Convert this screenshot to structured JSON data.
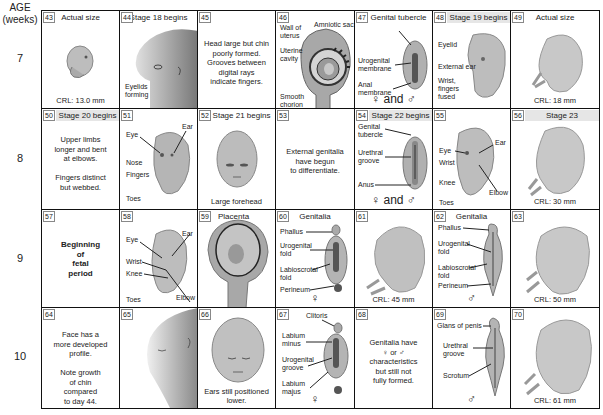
{
  "axis": {
    "header": "AGE\n(weeks)",
    "weeks": [
      "7",
      "8",
      "9",
      "10"
    ]
  },
  "cells": {
    "c43": {
      "num": "43",
      "header": "Actual size",
      "crl": "CRL: 13.0 mm"
    },
    "c44": {
      "num": "44",
      "header": "Stage 18 begins",
      "labels": [
        "Eyelids\nforming"
      ]
    },
    "c45": {
      "num": "45",
      "text": "Head large but chin\npoorly formed.\nGrooves between\ndigital rays\nindicate fingers."
    },
    "c46": {
      "num": "46",
      "labels": [
        "Wall of\nuterus",
        "Amniotic sac",
        "Uterine\ncavity",
        "Smooth\nchorion"
      ]
    },
    "c47": {
      "num": "47",
      "header": "Genital tubercle",
      "labels": [
        "Urogenital\nmembrane",
        "Anal\nmembrane"
      ],
      "symbol": "♀ and ♂"
    },
    "c48": {
      "num": "48",
      "header": "Stage 19 begins",
      "labels": [
        "Eyelid",
        "External ear",
        "Wrist,\nfingers\nfused"
      ]
    },
    "c49": {
      "num": "49",
      "header": "Actual size",
      "crl": "CRL: 18 mm"
    },
    "c50": {
      "num": "50",
      "header": "Stage 20 begins",
      "text": "Upper limbs\nlonger and bent\nat elbows.\n\nFingers distinct\nbut webbed."
    },
    "c51": {
      "num": "51",
      "labels": [
        "Eye",
        "Ear",
        "Nose",
        "Fingers",
        "Toes"
      ]
    },
    "c52": {
      "num": "52",
      "header": "Stage 21 begins",
      "caption": "Large forehead"
    },
    "c53": {
      "num": "53",
      "text": "External genitalia\nhave begun\nto differentiate."
    },
    "c54": {
      "num": "54",
      "header": "Stage 22 begins",
      "labels": [
        "Genital\ntubercle",
        "Urethral\ngroove",
        "Anus"
      ],
      "symbol": "♀ and ♂"
    },
    "c55": {
      "num": "55",
      "labels": [
        "Eye",
        "Ear",
        "Wrist",
        "Knee",
        "Elbow",
        "Toes"
      ]
    },
    "c56": {
      "num": "56",
      "header": "Stage 23",
      "crl": "CRL: 30 mm"
    },
    "c57": {
      "num": "57",
      "text": "Beginning\nof\nfetal\nperiod"
    },
    "c58": {
      "num": "58",
      "labels": [
        "Eye",
        "Ear",
        "Wrist",
        "Knee",
        "Elbow",
        "Toes"
      ]
    },
    "c59": {
      "num": "59",
      "labels": [
        "Placenta"
      ]
    },
    "c60": {
      "num": "60",
      "header": "Genitalia",
      "labels": [
        "Phallus",
        "Urogenital\nfold",
        "Labioscrotal\nfold",
        "Perineum"
      ],
      "symbol": "♀"
    },
    "c61": {
      "num": "61",
      "crl": "CRL: 45 mm"
    },
    "c62": {
      "num": "62",
      "header": "Genitalia",
      "labels": [
        "Phallus",
        "Urogenital\nfold",
        "Labioscrotal\nfold",
        "Perineum"
      ],
      "symbol": "♂"
    },
    "c63": {
      "num": "63",
      "crl": "CRL: 50 mm"
    },
    "c64": {
      "num": "64",
      "text": "Face has a\nmore developed\nprofile.\n\nNote growth\nof chin\ncompared\nto day 44."
    },
    "c65": {
      "num": "65"
    },
    "c66": {
      "num": "66",
      "caption": "Ears still positioned\nlower."
    },
    "c67": {
      "num": "67",
      "labels": [
        "Clitoris",
        "Labium\nminus",
        "Urogenital\ngroove",
        "Labium\nmajus"
      ],
      "symbol": "♀"
    },
    "c68": {
      "num": "68",
      "text": "Genitalia have\n♀ or ♂\ncharacteristics\nbut still not\nfully formed."
    },
    "c69": {
      "num": "69",
      "labels": [
        "Glans of penis",
        "Urethral\ngroove",
        "Scrotum"
      ],
      "symbol": "♂"
    },
    "c70": {
      "num": "70",
      "crl": "CRL: 61 mm"
    }
  },
  "colors": {
    "border": "#111111",
    "embryo_fill": "#bdbdbd",
    "embryo_dark": "#8a8a8a",
    "header_shade": "#e6e6e6"
  }
}
